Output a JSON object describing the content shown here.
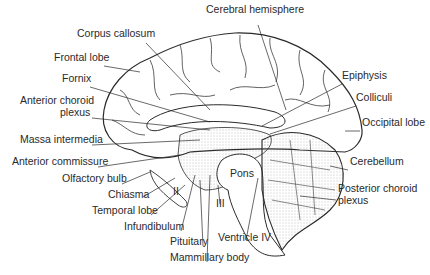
{
  "diagram": {
    "type": "anatomical-illustration",
    "labels": [
      {
        "id": "cerebral-hemisphere",
        "text": "Cerebral hemisphere",
        "x": 206,
        "y": 12,
        "align": "left",
        "line": [
          [
            258,
            25
          ],
          [
            286,
            110
          ]
        ]
      },
      {
        "id": "corpus-callosum",
        "text": "Corpus callosum",
        "x": 77,
        "y": 36,
        "align": "left",
        "line": [
          [
            146,
            43
          ],
          [
            210,
            110
          ]
        ]
      },
      {
        "id": "frontal-lobe",
        "text": "Frontal lobe",
        "x": 54,
        "y": 60,
        "align": "left",
        "line": [
          [
            104,
            66
          ],
          [
            140,
            72
          ]
        ]
      },
      {
        "id": "fornix",
        "text": "Fornix",
        "x": 62,
        "y": 81,
        "align": "left",
        "line": [
          [
            90,
            87
          ],
          [
            210,
            122
          ]
        ]
      },
      {
        "id": "anterior-choroid-plexus-1",
        "text": "Anterior choroid",
        "x": 20,
        "y": 103,
        "align": "left",
        "line": null
      },
      {
        "id": "anterior-choroid-plexus-2",
        "text": "plexus",
        "x": 60,
        "y": 115,
        "align": "left",
        "line": [
          [
            92,
            118
          ],
          [
            210,
            130
          ]
        ]
      },
      {
        "id": "massa-intermedia",
        "text": "Massa intermedia",
        "x": 20,
        "y": 142,
        "align": "left",
        "line": [
          [
            92,
            145
          ],
          [
            200,
            140
          ]
        ]
      },
      {
        "id": "anterior-commissure",
        "text": "Anterior commissure",
        "x": 12,
        "y": 164,
        "align": "left",
        "line": [
          [
            98,
            167
          ],
          [
            180,
            155
          ]
        ]
      },
      {
        "id": "olfactory-bulb",
        "text": "Olfactory bulb",
        "x": 62,
        "y": 181,
        "align": "left",
        "line": [
          [
            122,
            184
          ],
          [
            150,
            172
          ]
        ]
      },
      {
        "id": "chiasma",
        "text": "Chiasma",
        "x": 108,
        "y": 197,
        "align": "left",
        "line": [
          [
            143,
            197
          ],
          [
            175,
            178
          ]
        ]
      },
      {
        "id": "temporal-lobe",
        "text": "Temporal lobe",
        "x": 92,
        "y": 213,
        "align": "left",
        "line": [
          [
            151,
            215
          ],
          [
            185,
            185
          ]
        ]
      },
      {
        "id": "optic-nerve-II",
        "text": "II",
        "x": 173,
        "y": 194,
        "align": "left",
        "line": null
      },
      {
        "id": "infundibulum",
        "text": "Infundibulum",
        "x": 124,
        "y": 229,
        "align": "left",
        "line": [
          [
            181,
            231
          ],
          [
            195,
            175
          ]
        ]
      },
      {
        "id": "pituitary",
        "text": "Pituitary",
        "x": 170,
        "y": 244,
        "align": "left",
        "line": [
          [
            203,
            246
          ],
          [
            200,
            180
          ]
        ]
      },
      {
        "id": "mammillary-body",
        "text": "Mammillary body",
        "x": 170,
        "y": 260,
        "align": "left",
        "line": [
          [
            207,
            262
          ],
          [
            210,
            175
          ]
        ]
      },
      {
        "id": "oculomotor-III",
        "text": "III",
        "x": 216,
        "y": 206,
        "align": "left",
        "line": [
          [
            220,
            204
          ],
          [
            218,
            185
          ]
        ]
      },
      {
        "id": "pons",
        "text": "Pons",
        "x": 230,
        "y": 176,
        "align": "left",
        "line": null
      },
      {
        "id": "ventricle-iv",
        "text": "Ventricle IV",
        "x": 218,
        "y": 240,
        "align": "left",
        "line": [
          [
            246,
            240
          ],
          [
            258,
            178
          ]
        ]
      },
      {
        "id": "epiphysis",
        "text": "Epiphysis",
        "x": 342,
        "y": 78,
        "align": "left",
        "line": [
          [
            342,
            84
          ],
          [
            262,
            126
          ]
        ]
      },
      {
        "id": "colliculi",
        "text": "Colliculi",
        "x": 356,
        "y": 100,
        "align": "left",
        "line": [
          [
            356,
            106
          ],
          [
            270,
            134
          ]
        ]
      },
      {
        "id": "occipital-lobe",
        "text": "Occipital lobe",
        "x": 362,
        "y": 125,
        "align": "left",
        "line": [
          [
            360,
            131
          ],
          [
            345,
            131
          ]
        ]
      },
      {
        "id": "cerebellum",
        "text": "Cerebellum",
        "x": 350,
        "y": 164,
        "align": "left",
        "line": [
          [
            348,
            170
          ],
          [
            330,
            166
          ]
        ]
      },
      {
        "id": "posterior-choroid-plexus-1",
        "text": "Posterior choroid",
        "x": 338,
        "y": 191,
        "align": "left",
        "line": [
          [
            336,
            200
          ],
          [
            300,
            196
          ]
        ]
      },
      {
        "id": "posterior-choroid-plexus-2",
        "text": "plexus",
        "x": 338,
        "y": 203,
        "align": "left",
        "line": null
      }
    ],
    "colors": {
      "ink": "#2a2a2a",
      "stipple": "#8a8a8a",
      "paper": "#ffffff"
    }
  }
}
